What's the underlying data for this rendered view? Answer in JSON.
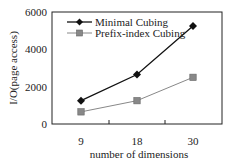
{
  "chart_data": {
    "type": "line",
    "title": "",
    "xlabel": "number of dimensions",
    "ylabel": "I/O(page access)",
    "categories": [
      "9",
      "18",
      "30"
    ],
    "x": [
      9,
      18,
      30
    ],
    "ylim": [
      0,
      6000
    ],
    "yticks": [
      "0",
      "2000",
      "4000",
      "6000"
    ],
    "xticks": [
      "9",
      "18",
      "30"
    ],
    "grid": false,
    "legend_position": "upper-left-inside",
    "series": [
      {
        "name": "Minimal Cubing",
        "marker": "diamond",
        "color": "#111111",
        "values": [
          1250,
          2650,
          5250
        ]
      },
      {
        "name": "Prefix-index Cubing",
        "marker": "square",
        "color": "#777777",
        "values": [
          650,
          1250,
          2500
        ]
      }
    ]
  }
}
